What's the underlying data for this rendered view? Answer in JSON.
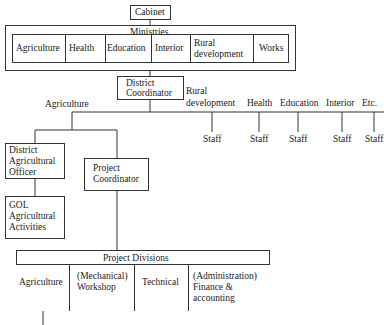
{
  "cabinet": "Cabinet",
  "ministries": {
    "title": "Ministries",
    "items": [
      "Agriculture",
      "Health",
      "Education",
      "Interior",
      "Rural",
      "development",
      "Works"
    ],
    "rural_line1": "Rural",
    "rural_line2": "development"
  },
  "district_coordinator": {
    "line1": "District",
    "line2": "Coordinator"
  },
  "branches": {
    "agriculture": "Agriculture",
    "rural_line1": "Rural",
    "rural_line2": "development",
    "health": "Health",
    "education": "Education",
    "interior": "Interior",
    "etc": "Etc."
  },
  "staff": [
    "Staff",
    "Staff",
    "Staff",
    "Staff",
    "Staff"
  ],
  "district_agricultural_officer": {
    "line1": "District",
    "line2": "Agricultural",
    "line3": "Officer"
  },
  "project_coordinator": {
    "line1": "Project",
    "line2": "Coordinator"
  },
  "gol": {
    "line1": "GOL",
    "line2": "Agricultural",
    "line3": "Activities"
  },
  "project_divisions": {
    "title": "Project Divisions",
    "agriculture": "Agriculture",
    "mechanical_line1": "(Mechanical)",
    "mechanical_line2": "Workshop",
    "technical": "Technical",
    "admin_line1": "(Administration)",
    "admin_line2": "Finance &",
    "admin_line3": "accounting"
  }
}
